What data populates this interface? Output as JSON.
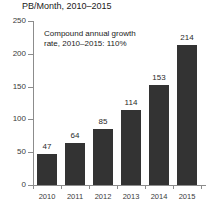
{
  "chart_data": {
    "type": "bar",
    "title": "PB/Month, 2010–2015",
    "xlabel": "",
    "ylabel": "",
    "categories": [
      "2010",
      "2011",
      "2012",
      "2013",
      "2014",
      "2015"
    ],
    "values": [
      47,
      64,
      85,
      114,
      153,
      214
    ],
    "ylim": [
      0,
      250
    ],
    "yticks": [
      0,
      50,
      100,
      150,
      200,
      250
    ],
    "ytick_labels": [
      "0",
      "50",
      "100",
      "150",
      "200",
      "250"
    ],
    "grid": false,
    "legend": null,
    "bar_color": "#333333",
    "axis_color": "#8c8c8c",
    "annotations": [
      {
        "line1": "Compound annual growth",
        "line2": "rate, 2010–2015: 110%"
      }
    ]
  }
}
